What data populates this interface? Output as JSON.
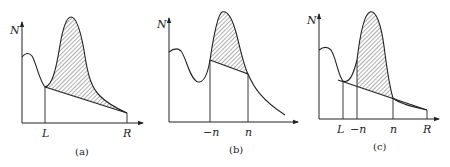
{
  "figure": {
    "panels": [
      {
        "id": "a",
        "caption": "(a)",
        "y_axis_label": "N",
        "x_marks": [
          "L",
          "R"
        ],
        "description": "Hatched area between peak and straight chord from L to R"
      },
      {
        "id": "b",
        "caption": "(b)",
        "y_axis_label": "N",
        "x_marks": [
          "−n",
          "n"
        ],
        "description": "Hatched area between peak and chord from −n to n"
      },
      {
        "id": "c",
        "caption": "(c)",
        "y_axis_label": "N",
        "x_marks": [
          "L",
          "−n",
          "n",
          "R"
        ],
        "description": "Hatched area between −n and n above chord from L to R"
      }
    ],
    "colors": {
      "ink": "#222222",
      "background": "#ffffff"
    }
  }
}
